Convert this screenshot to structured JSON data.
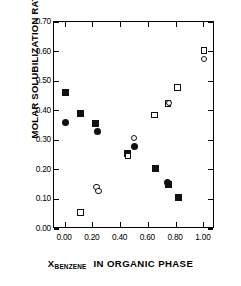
{
  "chart_data": {
    "type": "scatter",
    "title": "",
    "xlabel": "X_BENZENE IN ORGANIC PHASE",
    "xlabel_parts": {
      "symbol": "X",
      "subscript": "BENZENE",
      "rest": "IN ORGANIC PHASE"
    },
    "ylabel": "MOLAR SOLUBILIZATION RATIO",
    "xlim": [
      -0.08,
      1.08
    ],
    "ylim": [
      0.0,
      0.7
    ],
    "grid": false,
    "legend": "none",
    "xticks": [
      "0.00",
      "0.20",
      "0.40",
      "0.60",
      "0.80",
      "1.00"
    ],
    "xtick_values": [
      0.0,
      0.2,
      0.4,
      0.6,
      0.8,
      1.0
    ],
    "yticks": [
      "0.00",
      "0.10",
      "0.20",
      "0.30",
      "0.40",
      "0.50",
      "0.60",
      "0.70"
    ],
    "ytick_values": [
      0.0,
      0.1,
      0.2,
      0.3,
      0.4,
      0.5,
      0.6,
      0.7
    ],
    "series": [
      {
        "name": "filled-square",
        "marker": "filled square",
        "color": "#111111",
        "points": [
          {
            "x": 0.0,
            "y": 0.46
          },
          {
            "x": 0.11,
            "y": 0.389
          },
          {
            "x": 0.22,
            "y": 0.358
          },
          {
            "x": 0.45,
            "y": 0.256
          },
          {
            "x": 0.65,
            "y": 0.206
          },
          {
            "x": 0.745,
            "y": 0.15
          },
          {
            "x": 0.82,
            "y": 0.106
          }
        ]
      },
      {
        "name": "filled-circle",
        "marker": "filled circle",
        "color": "#111111",
        "points": [
          {
            "x": 0.0,
            "y": 0.361
          },
          {
            "x": 0.235,
            "y": 0.33
          },
          {
            "x": 0.5,
            "y": 0.28
          },
          {
            "x": 0.735,
            "y": 0.157
          }
        ]
      },
      {
        "name": "open-square",
        "marker": "open square",
        "color": "#111111",
        "points": [
          {
            "x": 0.11,
            "y": 0.056
          },
          {
            "x": 0.455,
            "y": 0.246
          },
          {
            "x": 0.645,
            "y": 0.386
          },
          {
            "x": 0.74,
            "y": 0.425
          },
          {
            "x": 0.81,
            "y": 0.478
          },
          {
            "x": 1.0,
            "y": 0.603
          }
        ]
      },
      {
        "name": "open-circle",
        "marker": "open circle",
        "color": "#111111",
        "points": [
          {
            "x": 0.225,
            "y": 0.142
          },
          {
            "x": 0.24,
            "y": 0.128
          },
          {
            "x": 0.495,
            "y": 0.307
          },
          {
            "x": 0.748,
            "y": 0.427
          },
          {
            "x": 1.0,
            "y": 0.574
          }
        ]
      }
    ]
  }
}
